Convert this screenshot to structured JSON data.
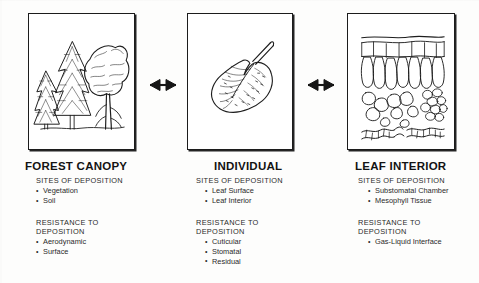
{
  "diagram": {
    "title_absent": true,
    "connectors": [
      {
        "name": "arrow-canopy-to-individual",
        "type": "double-headed-arrow"
      },
      {
        "name": "arrow-individual-to-leaf-interior",
        "type": "double-headed-arrow"
      }
    ],
    "columns": [
      {
        "id": "forest-canopy",
        "title": "FOREST CANOPY",
        "illustration": "forest-trees-illustration",
        "sections": [
          {
            "heading": "SITES OF DEPOSITION",
            "items": [
              "Vegetation",
              "Soil"
            ]
          },
          {
            "heading": "RESISTANCE TO DEPOSITION",
            "items": [
              "Aerodynamic",
              "Surface"
            ]
          }
        ]
      },
      {
        "id": "individual",
        "title": "INDIVIDUAL",
        "illustration": "single-leaf-illustration",
        "sections": [
          {
            "heading": "SITES OF DEPOSITION",
            "items": [
              "Leaf Surface",
              "Leaf Interior"
            ]
          },
          {
            "heading": "RESISTANCE TO DEPOSITION",
            "items": [
              "Cuticular",
              "Stomatal",
              "Residual"
            ]
          }
        ]
      },
      {
        "id": "leaf-interior",
        "title": "LEAF INTERIOR",
        "illustration": "leaf-cross-section-illustration",
        "sections": [
          {
            "heading": "SITES OF DEPOSITION",
            "items": [
              "Substomatal Chamber",
              "Mesophyll Tissue"
            ]
          },
          {
            "heading": "RESISTANCE TO DEPOSITION",
            "items": [
              "Gas-Liquid Interface"
            ]
          }
        ]
      }
    ],
    "colors": {
      "ink": "#1a1a1a",
      "page_background": "#fdfdfc",
      "panel_background": "#ffffff",
      "panel_border": "#1c1c1c"
    }
  }
}
